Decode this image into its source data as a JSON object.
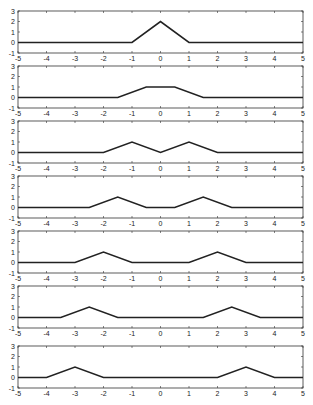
{
  "chart_data": [
    {
      "type": "line",
      "panel": 1,
      "xlim": [
        -5,
        5
      ],
      "ylim": [
        -1,
        3
      ],
      "x": [
        -5,
        -1,
        0,
        1,
        5
      ],
      "y": [
        0,
        0,
        2,
        0,
        0
      ]
    },
    {
      "type": "line",
      "panel": 2,
      "xlim": [
        -5,
        5
      ],
      "ylim": [
        -1,
        3
      ],
      "x": [
        -5,
        -1.5,
        -0.5,
        0.5,
        1.5,
        5
      ],
      "y": [
        0,
        0,
        1,
        1,
        0,
        0
      ]
    },
    {
      "type": "line",
      "panel": 3,
      "xlim": [
        -5,
        5
      ],
      "ylim": [
        -1,
        3
      ],
      "x": [
        -5,
        -2,
        -1,
        0,
        1,
        2,
        5
      ],
      "y": [
        0,
        0,
        1,
        0,
        1,
        0,
        0
      ]
    },
    {
      "type": "line",
      "panel": 4,
      "xlim": [
        -5,
        5
      ],
      "ylim": [
        -1,
        3
      ],
      "x": [
        -5,
        -2.5,
        -1.5,
        -0.5,
        0.5,
        1.5,
        2.5,
        5
      ],
      "y": [
        0,
        0,
        1,
        0,
        0,
        1,
        0,
        0
      ]
    },
    {
      "type": "line",
      "panel": 5,
      "xlim": [
        -5,
        5
      ],
      "ylim": [
        -1,
        3
      ],
      "x": [
        -5,
        -3,
        -2,
        -1,
        1,
        2,
        3,
        5
      ],
      "y": [
        0,
        0,
        1,
        0,
        0,
        1,
        0,
        0
      ]
    },
    {
      "type": "line",
      "panel": 6,
      "xlim": [
        -5,
        5
      ],
      "ylim": [
        -1,
        3
      ],
      "x": [
        -5,
        -3.5,
        -2.5,
        -1.5,
        1.5,
        2.5,
        3.5,
        5
      ],
      "y": [
        0,
        0,
        1,
        0,
        0,
        1,
        0,
        0
      ]
    },
    {
      "type": "line",
      "panel": 7,
      "xlim": [
        -5,
        5
      ],
      "ylim": [
        -1,
        3
      ],
      "x": [
        -5,
        -4,
        -3,
        -2,
        2,
        3,
        4,
        5
      ],
      "y": [
        0,
        0,
        1,
        0,
        0,
        1,
        0,
        0
      ]
    }
  ],
  "axes": {
    "xticks": [
      -5,
      -4,
      -3,
      -2,
      -1,
      0,
      1,
      2,
      3,
      4,
      5
    ],
    "yticks": [
      -1,
      0,
      1,
      2,
      3
    ],
    "xtick_labels": [
      "-5",
      "-4",
      "-3",
      "-2",
      "-1",
      "0",
      "1",
      "2",
      "3",
      "4",
      "5"
    ],
    "ytick_labels": [
      "-1",
      "0",
      "1",
      "2",
      "3"
    ],
    "grid": false,
    "line_color": "#222222"
  },
  "layout": {
    "left": 18,
    "right": 303,
    "panel_tops": [
      11,
      66,
      121,
      176,
      231,
      286,
      346
    ],
    "panel_height": 42
  }
}
